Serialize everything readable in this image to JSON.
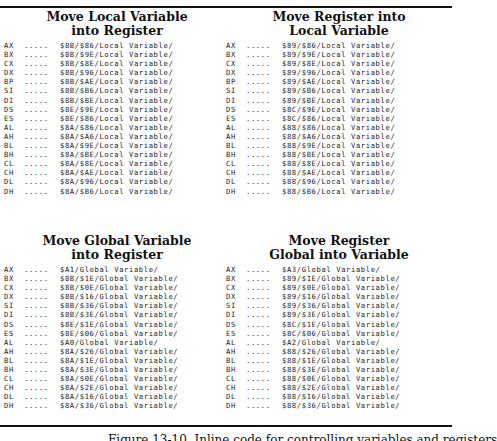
{
  "sections": [
    {
      "title_line1": "Move Local Variable",
      "title_line2": "into Register",
      "rows": [
        {
          "reg": "AX",
          "dots": ".....",
          "code": "$8B/$86/Local Variable/"
        },
        {
          "reg": "BX",
          "dots": ".....",
          "code": "$8B/$9E/Local Variable/"
        },
        {
          "reg": "CX",
          "dots": ".....",
          "code": "$8B/$8E/Local Variable/"
        },
        {
          "reg": "DX",
          "dots": ".....",
          "code": "$8B/$96/Local Variable/"
        },
        {
          "reg": "BP",
          "dots": ".....",
          "code": "$8B/$AE/Local Variable/"
        },
        {
          "reg": "SI",
          "dots": ".....",
          "code": "$8B/$B6/Local Variable/"
        },
        {
          "reg": "DI",
          "dots": ".....",
          "code": "$8B/$BE/Local Variable/"
        },
        {
          "reg": "DS",
          "dots": ".....",
          "code": "$8E/$9E/Local Variable/"
        },
        {
          "reg": "ES",
          "dots": ".....",
          "code": "$8E/$86/Local Variable/"
        },
        {
          "reg": "AL",
          "dots": ".....",
          "code": "$8A/$86/Local Variable/"
        },
        {
          "reg": "AH",
          "dots": ".....",
          "code": "$8A/$A6/Local Variable/"
        },
        {
          "reg": "BL",
          "dots": ".....",
          "code": "$8A/$9E/Local Variable/"
        },
        {
          "reg": "BH",
          "dots": ".....",
          "code": "$8A/$BE/Local Variable/"
        },
        {
          "reg": "CL",
          "dots": ".....",
          "code": "$8A/$8E/Local Variable/"
        },
        {
          "reg": "CH",
          "dots": ".....",
          "code": "$8A/$AE/Local Variable/"
        },
        {
          "reg": "DL",
          "dots": ".....",
          "code": "$8A/$96/Local Variable/"
        },
        {
          "reg": "DH",
          "dots": ".....",
          "code": "$8A/$B6/Local Variable/"
        }
      ]
    },
    {
      "title_line1": "Move Register into",
      "title_line2": "Local Variable",
      "rows": [
        {
          "reg": "AX",
          "dots": ".....",
          "code": "$89/$86/Local Variable/"
        },
        {
          "reg": "BX",
          "dots": ".....",
          "code": "$89/$9E/Local Variable/"
        },
        {
          "reg": "CX",
          "dots": ".....",
          "code": "$89/$8E/Local Variable/"
        },
        {
          "reg": "DX",
          "dots": ".....",
          "code": "$89/$96/Local Variable/"
        },
        {
          "reg": "BP",
          "dots": ".....",
          "code": "$89/$AE/Local Variable/"
        },
        {
          "reg": "SI",
          "dots": ".....",
          "code": "$89/$B6/Local Variable/"
        },
        {
          "reg": "DI",
          "dots": ".....",
          "code": "$89/$BE/Local Variable/"
        },
        {
          "reg": "DS",
          "dots": ".....",
          "code": "$8C/$9E/Local Variable/"
        },
        {
          "reg": "ES",
          "dots": ".....",
          "code": "$8C/$86/Local Variable/"
        },
        {
          "reg": "AL",
          "dots": ".....",
          "code": "$88/$86/Local Variable/"
        },
        {
          "reg": "AH",
          "dots": ".....",
          "code": "$88/$A6/Local Variable/"
        },
        {
          "reg": "BL",
          "dots": ".....",
          "code": "$88/$9E/Local Variable/"
        },
        {
          "reg": "BH",
          "dots": ".....",
          "code": "$88/$BE/Local Variable/"
        },
        {
          "reg": "CL",
          "dots": ".....",
          "code": "$88/$8E/Local Variable/"
        },
        {
          "reg": "CH",
          "dots": ".....",
          "code": "$88/$AE/Local Variable/"
        },
        {
          "reg": "DL",
          "dots": ".....",
          "code": "$88/$96/Local Variable/"
        },
        {
          "reg": "DH",
          "dots": ".....",
          "code": "$88/$B6/Local Variable/"
        }
      ]
    },
    {
      "title_line1": "Move Global Variable",
      "title_line2": "into Register",
      "rows": [
        {
          "reg": "AX",
          "dots": ".....",
          "code": "$A1/Global Variable/"
        },
        {
          "reg": "BX",
          "dots": ".....",
          "code": "$8B/$1E/Global Variable/"
        },
        {
          "reg": "CX",
          "dots": ".....",
          "code": "$8B/$0E/Global Variable/"
        },
        {
          "reg": "DX",
          "dots": ".....",
          "code": "$8B/$16/Global Variable/"
        },
        {
          "reg": "SI",
          "dots": ".....",
          "code": "$8B/$36/Global Variable/"
        },
        {
          "reg": "DI",
          "dots": ".....",
          "code": "$8B/$3E/Global Variable/"
        },
        {
          "reg": "DS",
          "dots": ".....",
          "code": "$8E/$1E/Global Variable/"
        },
        {
          "reg": "ES",
          "dots": ".....",
          "code": "$8E/$06/Global Variable/"
        },
        {
          "reg": "AL",
          "dots": ".....",
          "code": "$A0/Global Variable/"
        },
        {
          "reg": "AH",
          "dots": ".....",
          "code": "$8A/$26/Global Variable/"
        },
        {
          "reg": "BL",
          "dots": ".....",
          "code": "$8A/$1E/Global Variable/"
        },
        {
          "reg": "BH",
          "dots": ".....",
          "code": "$8A/$3E/Global Variable/"
        },
        {
          "reg": "CL",
          "dots": ".....",
          "code": "$8A/$0E/Global Variable/"
        },
        {
          "reg": "CH",
          "dots": ".....",
          "code": "$8A/$2E/Global Variable/"
        },
        {
          "reg": "DL",
          "dots": ".....",
          "code": "$8A/$16/Global Variable/"
        },
        {
          "reg": "DH",
          "dots": ".....",
          "code": "$8A/$36/Global Variable/"
        }
      ]
    },
    {
      "title_line1": "Move Register",
      "title_line2": "Global into Variable",
      "rows": [
        {
          "reg": "AX",
          "dots": ".....",
          "code": "$A3/Global Variable/"
        },
        {
          "reg": "BX",
          "dots": ".....",
          "code": "$89/$1E/Global Variable/"
        },
        {
          "reg": "CX",
          "dots": ".....",
          "code": "$89/$0E/Global Variable/"
        },
        {
          "reg": "DX",
          "dots": ".....",
          "code": "$89/$16/Global Variable/"
        },
        {
          "reg": "SI",
          "dots": ".....",
          "code": "$89/$36/Global Variable/"
        },
        {
          "reg": "DI",
          "dots": ".....",
          "code": "$89/$3E/Global Variable/"
        },
        {
          "reg": "DS",
          "dots": ".....",
          "code": "$8C/$1E/Global Variable/"
        },
        {
          "reg": "ES",
          "dots": ".....",
          "code": "$8C/$06/Global Variable/"
        },
        {
          "reg": "AL",
          "dots": ".....",
          "code": "$A2/Global Variable/"
        },
        {
          "reg": "AH",
          "dots": ".....",
          "code": "$88/$26/Global Variable/"
        },
        {
          "reg": "BL",
          "dots": ".....",
          "code": "$88/$1E/Global Variable/"
        },
        {
          "reg": "BH",
          "dots": ".....",
          "code": "$88/$3E/Global Variable/"
        },
        {
          "reg": "CL",
          "dots": ".....",
          "code": "$88/$0E/Global Variable/"
        },
        {
          "reg": "CH",
          "dots": ".....",
          "code": "$88/$2E/Global Variable/"
        },
        {
          "reg": "DL",
          "dots": ".....",
          "code": "$88/$16/Global Variable/"
        },
        {
          "reg": "DH",
          "dots": ".....",
          "code": "$88/$36/Global Variable/"
        }
      ]
    }
  ],
  "caption": "Figure 13-10.   Inline code for controlling variables and registers"
}
